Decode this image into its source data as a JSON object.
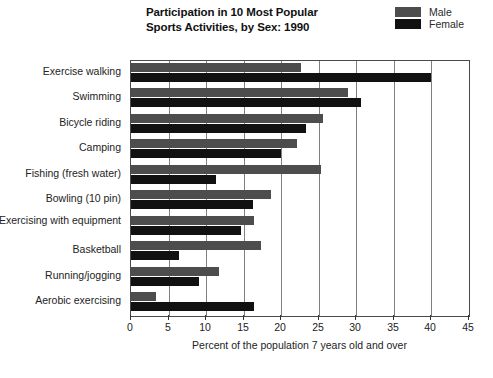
{
  "chart_data": {
    "type": "bar",
    "orientation": "horizontal",
    "title": "Participation in 10 Most Popular Sports Activities, by Sex: 1990",
    "title_lines": [
      "Participation in 10 Most Popular",
      "Sports Activities, by Sex: 1990"
    ],
    "xlabel": "Percent of the population 7 years old and over",
    "ylabel": "",
    "xlim": [
      0,
      45
    ],
    "xticks": [
      0,
      5,
      10,
      15,
      20,
      25,
      30,
      35,
      40,
      45
    ],
    "xticklabels": [
      "0",
      "5",
      "10",
      "15",
      "20",
      "25",
      "30",
      "35",
      "40",
      "45"
    ],
    "grid": "vertical",
    "legend_position": "top-right",
    "categories": [
      "Exercise walking",
      "Swimming",
      "Bicycle riding",
      "Camping",
      "Fishing (fresh water)",
      "Bowling (10 pin)",
      "Exercising with equipment",
      "Basketball",
      "Running/jogging",
      "Aerobic exercising"
    ],
    "series": [
      {
        "name": "Male",
        "color": "#4d4d4d",
        "values": [
          22.6,
          28.9,
          25.6,
          22.1,
          25.3,
          18.6,
          16.4,
          17.3,
          11.7,
          3.3
        ]
      },
      {
        "name": "Female",
        "color": "#111111",
        "values": [
          40.0,
          30.6,
          23.3,
          20.0,
          11.3,
          16.2,
          14.6,
          6.4,
          9.1,
          16.4
        ]
      }
    ]
  },
  "legend": {
    "entries": [
      {
        "label": "Male",
        "color": "#4d4d4d"
      },
      {
        "label": "Female",
        "color": "#111111"
      }
    ]
  },
  "colors": {
    "male": "#4d4d4d",
    "female": "#111111",
    "frame": "#4a4a4a",
    "gridline": "#808080",
    "text": "#232323",
    "background": "#ffffff"
  }
}
